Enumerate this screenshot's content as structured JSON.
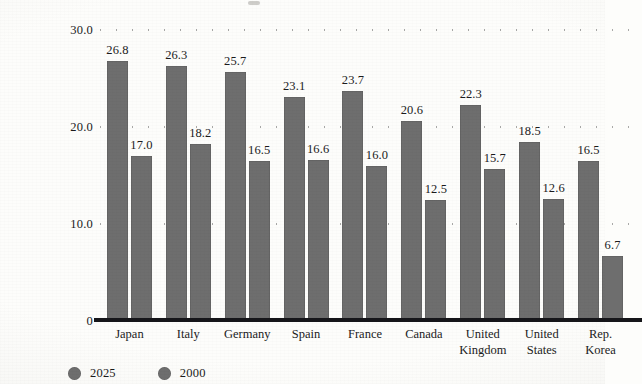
{
  "chart_data": {
    "type": "bar",
    "title": "",
    "subtitle": "",
    "xlabel": "",
    "ylabel": "",
    "ylim": [
      0,
      30
    ],
    "yticks": [
      0,
      10,
      20,
      30
    ],
    "ytick_labels": [
      "0",
      "10.0",
      "20.0",
      "30.0"
    ],
    "grid": true,
    "grid_style": "dotted-horizontal",
    "legend_position": "bottom-left",
    "categories": [
      "Japan",
      "Italy",
      "Germany",
      "Spain",
      "France",
      "Canada",
      "United Kingdom",
      "United States",
      "Rep. Korea"
    ],
    "category_lines": [
      [
        "Japan"
      ],
      [
        "Italy"
      ],
      [
        "Germany"
      ],
      [
        "Spain"
      ],
      [
        "France"
      ],
      [
        "Canada"
      ],
      [
        "United",
        "Kingdom"
      ],
      [
        "United",
        "States"
      ],
      [
        "Rep.",
        "Korea"
      ]
    ],
    "series": [
      {
        "name": "2025",
        "color": "#6e6e6e",
        "values": [
          26.8,
          26.3,
          25.7,
          23.1,
          23.7,
          20.6,
          22.3,
          18.5,
          16.5
        ],
        "labels": [
          "26.8",
          "26.3",
          "25.7",
          "23.1",
          "23.7",
          "20.6",
          "22.3",
          "18.5",
          "16.5"
        ]
      },
      {
        "name": "2000",
        "color": "#6e6e6e",
        "values": [
          17.0,
          18.2,
          16.5,
          16.6,
          16.0,
          12.5,
          15.7,
          12.6,
          6.7
        ],
        "labels": [
          "17.0",
          "18.2",
          "16.5",
          "16.6",
          "16.0",
          "12.5",
          "15.7",
          "12.6",
          "6.7"
        ]
      }
    ]
  },
  "legend": {
    "items": [
      {
        "label": "2025",
        "swatch": "legend-swatch-2025"
      },
      {
        "label": "2000",
        "swatch": "legend-swatch-2000"
      }
    ]
  },
  "colors": {
    "bar_fill": "#6e6e6e",
    "axis_line": "#16161a",
    "text": "#1b1b1b",
    "page_background": "#fdfdfb"
  }
}
